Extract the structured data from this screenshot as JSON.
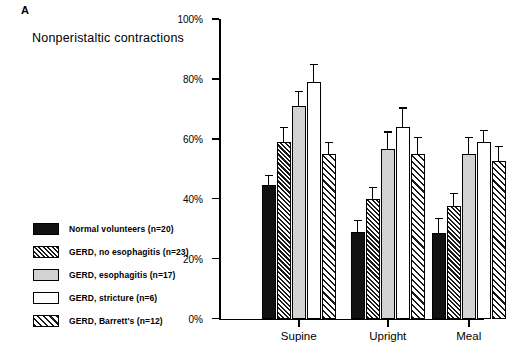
{
  "panel": {
    "label": "A"
  },
  "title": "Nonperistaltic contractions",
  "legend": {
    "items": [
      {
        "label": "Normal volunteers (n=20)",
        "fill": "solid-black"
      },
      {
        "label": "GERD, no esophagitis (n=23)",
        "fill": "dense-hatch"
      },
      {
        "label": "GERD, esophagitis (n=17)",
        "fill": "light-gray"
      },
      {
        "label": "GERD, stricture (n=6)",
        "fill": "white"
      },
      {
        "label": "GERD, Barrett's (n=12)",
        "fill": "diagonal-hatch"
      }
    ]
  },
  "chart_data": {
    "type": "bar",
    "title": "Nonperistaltic contractions",
    "xlabel": "",
    "ylabel": "",
    "ylim": [
      0,
      100
    ],
    "ytick_labels": [
      "0%",
      "20%",
      "40%",
      "60%",
      "80%",
      "100%"
    ],
    "ytick_values": [
      0,
      20,
      40,
      60,
      80,
      100
    ],
    "grid": false,
    "legend_position": "left",
    "categories": [
      "Supine",
      "Upright",
      "Meal"
    ],
    "series": [
      {
        "name": "Normal volunteers (n=20)",
        "values": [
          44.5,
          29,
          28.5
        ],
        "errors": [
          3.5,
          4,
          5
        ]
      },
      {
        "name": "GERD, no esophagitis (n=23)",
        "values": [
          59,
          40,
          37.5
        ],
        "errors": [
          5,
          4,
          4.5
        ]
      },
      {
        "name": "GERD, esophagitis (n=17)",
        "values": [
          71,
          56.5,
          55
        ],
        "errors": [
          5,
          6,
          5.5
        ]
      },
      {
        "name": "GERD, stricture (n=6)",
        "values": [
          79,
          64,
          59
        ],
        "errors": [
          6,
          6.5,
          4
        ]
      },
      {
        "name": "GERD, Barrett's (n=12)",
        "values": [
          55,
          55,
          52.5
        ],
        "errors": [
          4,
          5.5,
          5
        ]
      }
    ]
  }
}
